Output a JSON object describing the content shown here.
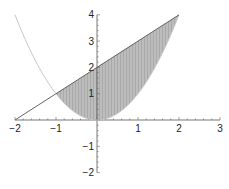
{
  "chart_data": {
    "type": "area",
    "title": "",
    "xlabel": "",
    "ylabel": "",
    "xlim": [
      -2,
      3
    ],
    "ylim": [
      -2,
      4
    ],
    "grid": false,
    "legend": null,
    "x_ticks": [
      -2,
      -1,
      1,
      2,
      3
    ],
    "y_ticks": [
      -2,
      -1,
      1,
      2,
      3,
      4
    ],
    "x_tick_labels": [
      "−2",
      "−1",
      "1",
      "2",
      "3"
    ],
    "y_tick_labels": [
      "−2",
      "−1",
      "1",
      "2",
      "3",
      "4"
    ],
    "series": [
      {
        "name": "y = x^2",
        "kind": "line",
        "color": "#c8c8c8",
        "x": [
          -2,
          -1.5,
          -1,
          -0.5,
          0,
          0.5,
          1,
          1.5,
          2
        ],
        "y": [
          4,
          2.25,
          1,
          0.25,
          0,
          0.25,
          1,
          2.25,
          4
        ]
      },
      {
        "name": "y = x + 2",
        "kind": "line",
        "color": "#555555",
        "x": [
          -2,
          -1,
          0,
          1,
          2
        ],
        "y": [
          0,
          1,
          2,
          3,
          4
        ]
      }
    ],
    "shaded_region": {
      "description": "region between y = x + 2 (upper) and y = x^2 (lower)",
      "x_from": -1,
      "x_to": 2,
      "fill": "#b9b9b9",
      "pattern": "vertical-stripes"
    },
    "intersections": [
      [
        -1,
        1
      ],
      [
        2,
        4
      ]
    ]
  }
}
